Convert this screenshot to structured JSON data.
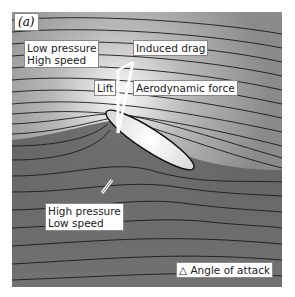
{
  "figure": {
    "panel_label": "(a)",
    "labels": {
      "low_pressure_line1": "Low pressure",
      "low_pressure_line2": "High speed",
      "induced_drag": "Induced drag",
      "lift": "Lift",
      "aerodynamic_force": "Aerodynamic force",
      "high_pressure_line1": "High pressure",
      "high_pressure_line2": "Low speed",
      "angle_of_attack": "Angle of attack"
    },
    "colors": {
      "background_top": "#f4f4f4",
      "background_bottom": "#6a6a6a",
      "streamline": "#1a1a1a",
      "airfoil": "#f8f8f8"
    }
  }
}
